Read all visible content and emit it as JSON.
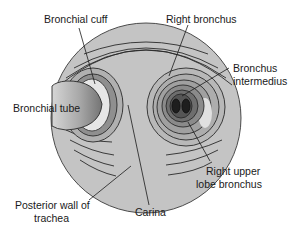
{
  "diagram": {
    "labels": {
      "bronchial_cuff": "Bronchial cuff",
      "right_bronchus": "Right bronchus",
      "bronchus_intermedius_1": "Bronchus",
      "bronchus_intermedius_2": "intermedius",
      "bronchial_tube": "Bronchial tube",
      "right_upper_lobe_1": "Right upper",
      "right_upper_lobe_2": "lobe bronchus",
      "posterior_wall_1": "Posterior wall of",
      "posterior_wall_2": "trachea",
      "carina": "Carina"
    },
    "colors": {
      "trachea_fill": "#c4c4c4",
      "ring_stroke": "#2a2a2a",
      "cuff_dark": "#8f8f8f",
      "cuff_light": "#e4e4e4",
      "bronchus_mid": "#a0a0a0",
      "bronchus_dark": "#5a5a5a",
      "bronchus_core": "#1e1e1e",
      "tube_light": "#d8d8d8",
      "tube_dark": "#7a7a7a"
    }
  }
}
